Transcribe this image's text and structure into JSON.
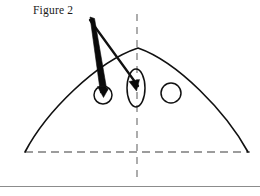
{
  "document": {
    "caption": "Figure 2",
    "background_color": "#ffffff",
    "ink_color": "#000000",
    "rule_color": "#8c8c8c"
  },
  "figure": {
    "width": 260,
    "height": 196,
    "dome_curve": {
      "name": "dome-arc",
      "left_base": [
        25,
        152
      ],
      "apex": [
        138,
        48
      ],
      "right_base": [
        248,
        152
      ],
      "stroke_width": 1.6
    },
    "baseline": {
      "name": "dashed-baseline",
      "y": 152,
      "x_start": 25,
      "x_end": 250,
      "dash": "8 5",
      "stroke_width": 1.1
    },
    "centerline": {
      "name": "dashed-centerline",
      "x": 137,
      "y_start": 14,
      "y_end": 179,
      "dash": "7 6",
      "stroke_width": 1.1
    },
    "shapes": [
      {
        "name": "small-circle",
        "type": "circle",
        "cx": 103,
        "cy": 95,
        "r": 9,
        "stroke_width": 1.5
      },
      {
        "name": "tall-ellipse",
        "type": "ellipse",
        "cx": 136,
        "cy": 88,
        "rx": 9,
        "ry": 19,
        "stroke_width": 1.5
      },
      {
        "name": "right-circle",
        "type": "circle",
        "cx": 171,
        "cy": 93,
        "r": 10,
        "stroke_width": 1.5
      }
    ],
    "leaders": [
      {
        "name": "thick-leader-wedge",
        "apex": [
          90,
          18
        ],
        "target": [
          103,
          92
        ],
        "style": "tapered-wedge",
        "max_width": 7
      },
      {
        "name": "thin-leader-line",
        "apex": [
          90,
          19
        ],
        "target": [
          137,
          84
        ],
        "style": "line",
        "stroke_width": 2.2
      }
    ],
    "arrowheads": [
      {
        "name": "arrowhead-small-circle",
        "tip": [
          104,
          96
        ],
        "angle_deg": 100
      },
      {
        "name": "arrowhead-ellipse",
        "tip": [
          136,
          90
        ],
        "angle_deg": 62
      }
    ]
  },
  "footer": {
    "rule_y": 186
  }
}
